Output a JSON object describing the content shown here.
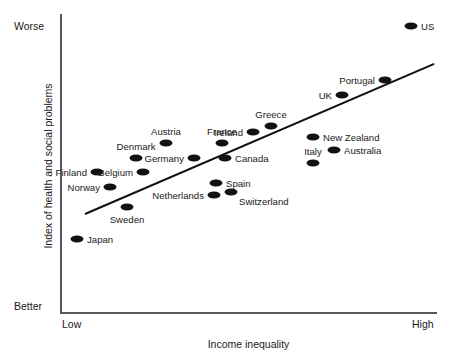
{
  "top_fragment": "",
  "axes": {
    "ylabel": "Index of health and social problems",
    "xlabel": "Income inequality",
    "y_top_tick": "Worse",
    "y_bottom_tick": "Better",
    "x_left_tick": "Low",
    "x_right_tick": "High"
  },
  "chart_data": {
    "type": "scatter",
    "title": "",
    "xlabel": "Income inequality",
    "ylabel": "Index of health and social problems",
    "xlim": [
      0,
      1
    ],
    "ylim": [
      0,
      1
    ],
    "xticklabels": [
      "Low",
      "High"
    ],
    "yticklabels": [
      "Better",
      "Worse"
    ],
    "grid": false,
    "legend": null,
    "marker_color": "#111111",
    "trendline": {
      "color": "#111111",
      "x_start_px": 85,
      "y_start_px": 213,
      "x_end_px": 434,
      "y_end_px": 63
    },
    "points": [
      {
        "label": "US",
        "x_px": 411,
        "y_px": 26,
        "label_pos": "right"
      },
      {
        "label": "Portugal",
        "x_px": 385,
        "y_px": 80,
        "label_pos": "left"
      },
      {
        "label": "UK",
        "x_px": 342,
        "y_px": 95,
        "label_pos": "left"
      },
      {
        "label": "Greece",
        "x_px": 271,
        "y_px": 126,
        "label_pos": "above"
      },
      {
        "label": "Ireland",
        "x_px": 253,
        "y_px": 132,
        "label_pos": "left"
      },
      {
        "label": "New Zealand",
        "x_px": 313,
        "y_px": 137,
        "label_pos": "right"
      },
      {
        "label": "Austria",
        "x_px": 166,
        "y_px": 143,
        "label_pos": "above"
      },
      {
        "label": "France",
        "x_px": 222,
        "y_px": 143,
        "label_pos": "above"
      },
      {
        "label": "Australia",
        "x_px": 334,
        "y_px": 150,
        "label_pos": "right"
      },
      {
        "label": "Denmark",
        "x_px": 136,
        "y_px": 158,
        "label_pos": "above"
      },
      {
        "label": "Germany",
        "x_px": 194,
        "y_px": 158,
        "label_pos": "left"
      },
      {
        "label": "Canada",
        "x_px": 225,
        "y_px": 158,
        "label_pos": "right"
      },
      {
        "label": "Italy",
        "x_px": 313,
        "y_px": 163,
        "label_pos": "above"
      },
      {
        "label": "Finland",
        "x_px": 97,
        "y_px": 172,
        "label_pos": "left"
      },
      {
        "label": "Belgium",
        "x_px": 143,
        "y_px": 172,
        "label_pos": "left"
      },
      {
        "label": "Norway",
        "x_px": 110,
        "y_px": 187,
        "label_pos": "left"
      },
      {
        "label": "Spain",
        "x_px": 216,
        "y_px": 183,
        "label_pos": "right"
      },
      {
        "label": "Switzerland",
        "x_px": 231,
        "y_px": 192,
        "label_pos": "below-right"
      },
      {
        "label": "Netherlands",
        "x_px": 214,
        "y_px": 195,
        "label_pos": "left"
      },
      {
        "label": "Sweden",
        "x_px": 127,
        "y_px": 207,
        "label_pos": "below"
      },
      {
        "label": "Japan",
        "x_px": 77,
        "y_px": 239,
        "label_pos": "right"
      }
    ]
  }
}
